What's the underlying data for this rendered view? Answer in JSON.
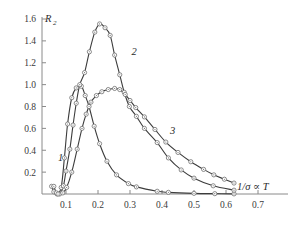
{
  "chart_data": {
    "type": "line",
    "title": "",
    "subtitle": "",
    "xlabel": "1/σ ∝ T",
    "ylabel": "R",
    "ylabel_sub": "2",
    "xlim": [
      0.04,
      0.72
    ],
    "ylim": [
      0.0,
      1.62
    ],
    "grid": false,
    "legend": "inline-curve-labels",
    "x_ticks": [
      {
        "value": 0.1,
        "label": "0.1"
      },
      {
        "value": 0.2,
        "label": "0.2"
      },
      {
        "value": 0.3,
        "label": "0.3"
      },
      {
        "value": 0.4,
        "label": "0.4"
      },
      {
        "value": 0.5,
        "label": "0.5"
      },
      {
        "value": 0.6,
        "label": "0.6"
      },
      {
        "value": 0.7,
        "label": "0.7"
      }
    ],
    "y_ticks": [
      {
        "value": 0.2,
        "label": "0.2"
      },
      {
        "value": 0.4,
        "label": "0.4"
      },
      {
        "value": 0.6,
        "label": "0.6"
      },
      {
        "value": 0.8,
        "label": "0.8"
      },
      {
        "value": 1.0,
        "label": "1.0"
      },
      {
        "value": 1.2,
        "label": "1.2"
      },
      {
        "value": 1.4,
        "label": "1.4"
      },
      {
        "value": 1.6,
        "label": "1.6"
      }
    ],
    "series": [
      {
        "name": "1",
        "label": "1",
        "label_x": 0.075,
        "label_y": 0.3,
        "markers": true,
        "points": [
          [
            0.055,
            0.07
          ],
          [
            0.062,
            0.02
          ],
          [
            0.072,
            0.0
          ],
          [
            0.085,
            0.06
          ],
          [
            0.095,
            0.33
          ],
          [
            0.105,
            0.64
          ],
          [
            0.118,
            0.88
          ],
          [
            0.132,
            0.97
          ],
          [
            0.148,
            0.985
          ],
          [
            0.16,
            0.9
          ],
          [
            0.172,
            0.8
          ],
          [
            0.188,
            0.62
          ],
          [
            0.205,
            0.46
          ],
          [
            0.228,
            0.3
          ],
          [
            0.258,
            0.175
          ],
          [
            0.295,
            0.095
          ],
          [
            0.32,
            0.065
          ],
          [
            0.385,
            0.025
          ],
          [
            0.42,
            0.015
          ],
          [
            0.5,
            0.006
          ],
          [
            0.565,
            0.003
          ],
          [
            0.625,
            0.001
          ]
        ]
      },
      {
        "name": "2",
        "label": "2",
        "label_x": 0.305,
        "label_y": 1.27,
        "markers": true,
        "points": [
          [
            0.062,
            0.07
          ],
          [
            0.07,
            0.01
          ],
          [
            0.08,
            0.0
          ],
          [
            0.092,
            0.075
          ],
          [
            0.1,
            0.21
          ],
          [
            0.112,
            0.41
          ],
          [
            0.122,
            0.63
          ],
          [
            0.132,
            0.83
          ],
          [
            0.143,
            1.0
          ],
          [
            0.158,
            1.11
          ],
          [
            0.173,
            1.3
          ],
          [
            0.19,
            1.48
          ],
          [
            0.205,
            1.555
          ],
          [
            0.222,
            1.52
          ],
          [
            0.238,
            1.45
          ],
          [
            0.252,
            1.27
          ],
          [
            0.268,
            1.09
          ],
          [
            0.282,
            0.93
          ],
          [
            0.298,
            0.8
          ],
          [
            0.32,
            0.71
          ],
          [
            0.345,
            0.6
          ],
          [
            0.385,
            0.47
          ],
          [
            0.42,
            0.33
          ],
          [
            0.46,
            0.22
          ],
          [
            0.5,
            0.145
          ],
          [
            0.56,
            0.075
          ],
          [
            0.625,
            0.035
          ]
        ]
      },
      {
        "name": "3",
        "label": "3",
        "label_x": 0.425,
        "label_y": 0.55,
        "markers": true,
        "points": [
          [
            0.075,
            0.0
          ],
          [
            0.09,
            0.01
          ],
          [
            0.102,
            0.06
          ],
          [
            0.118,
            0.2
          ],
          [
            0.135,
            0.41
          ],
          [
            0.15,
            0.6
          ],
          [
            0.163,
            0.73
          ],
          [
            0.178,
            0.84
          ],
          [
            0.195,
            0.9
          ],
          [
            0.212,
            0.935
          ],
          [
            0.232,
            0.955
          ],
          [
            0.252,
            0.965
          ],
          [
            0.268,
            0.955
          ],
          [
            0.285,
            0.91
          ],
          [
            0.3,
            0.855
          ],
          [
            0.318,
            0.79
          ],
          [
            0.345,
            0.705
          ],
          [
            0.378,
            0.59
          ],
          [
            0.412,
            0.475
          ],
          [
            0.45,
            0.38
          ],
          [
            0.49,
            0.295
          ],
          [
            0.53,
            0.225
          ],
          [
            0.562,
            0.175
          ],
          [
            0.595,
            0.135
          ],
          [
            0.625,
            0.1
          ]
        ]
      }
    ],
    "notes": {
      "marker_style": "open circle with center dot",
      "curve_color": "#3c3c3c",
      "axis_color": "#8a8a8a"
    }
  }
}
